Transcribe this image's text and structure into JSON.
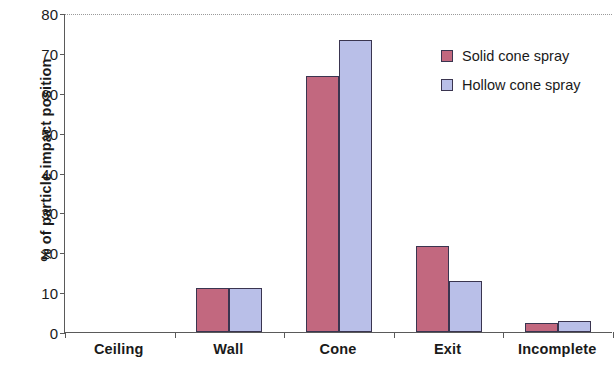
{
  "chart_data": {
    "type": "bar",
    "title": "",
    "xlabel": "",
    "ylabel": "% of particle impact position",
    "categories": [
      "Ceiling",
      "Wall",
      "Cone",
      "Exit",
      "Incomplete"
    ],
    "series": [
      {
        "name": "Solid cone spray",
        "color": "#c2687f",
        "values": [
          0,
          11.0,
          64.3,
          21.6,
          2.2
        ]
      },
      {
        "name": "Hollow cone spray",
        "color": "#b9bfe8",
        "values": [
          0,
          11.1,
          73.2,
          12.8,
          2.8
        ]
      }
    ],
    "ylim": [
      0,
      80
    ],
    "y_ticks": [
      0,
      10,
      20,
      30,
      40,
      50,
      60,
      70,
      80
    ],
    "y_tick_labels": [
      "0",
      "10",
      "20",
      "30",
      "40",
      "50",
      "60",
      "70",
      "80"
    ],
    "grid": "top-only",
    "legend_position": "upper-right",
    "bar_edge_color": "#3a3550",
    "axis_color": "#5a5a5a"
  }
}
